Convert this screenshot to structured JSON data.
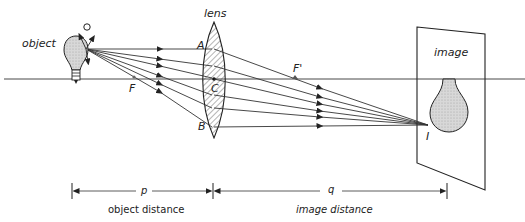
{
  "diagram": {
    "type": "converging-lens-image-formation",
    "labels": {
      "object": "object",
      "lens": "lens",
      "image": "image",
      "point_A": "A",
      "point_B": "B",
      "point_C": "C",
      "focus_F": "F",
      "focus_F_prime": "F'",
      "image_point": "I",
      "source_point": "O",
      "p": "p",
      "q": "q",
      "object_distance": "object distance",
      "image_distance": "image distance"
    },
    "colors": {
      "ink": "#222222",
      "bulb_fill": "#d6d6d6",
      "background": "#ffffff"
    }
  }
}
